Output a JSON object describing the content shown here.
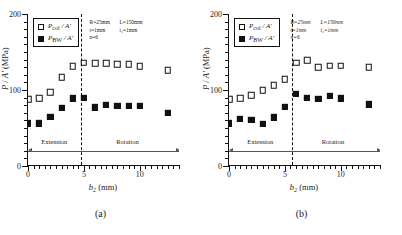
{
  "figure": {
    "panels": [
      {
        "caption": "(a)",
        "legend": [
          {
            "marker": "open-square",
            "label": "P",
            "sub": "col",
            "suffix": " / A'"
          },
          {
            "marker": "filled-square",
            "label": "P",
            "sub": "BW",
            "suffix": " / A'"
          }
        ],
        "annotation": {
          "line1_col1": "R=25mm",
          "line1_col2": "L=150mm",
          "line2_col1": "t=1mm",
          "line2_col2": "t₂=1mm",
          "line3": "n=6"
        },
        "regions": [
          {
            "name": "Extension",
            "center": 2.35
          },
          {
            "name": "Rotation",
            "center": 8.9
          }
        ],
        "divider_x": 4.7
      },
      {
        "caption": "(b)",
        "legend": [
          {
            "marker": "open-square",
            "label": "P",
            "sub": "col",
            "suffix": " / A'"
          },
          {
            "marker": "filled-square",
            "label": "P",
            "sub": "BW",
            "suffix": " / A'"
          }
        ],
        "annotation": {
          "line1_col1": "R=25mm",
          "line1_col2": "L=150mm",
          "line2_col1": "t=1mm",
          "line2_col2": "t₂=1mm",
          "line3": "n=6"
        },
        "regions": [
          {
            "name": "Extension",
            "center": 2.8
          },
          {
            "name": "Rotation",
            "center": 9.3
          }
        ],
        "divider_x": 5.6
      }
    ]
  },
  "chart_data": [
    {
      "type": "scatter",
      "title": "(a)",
      "xlabel": "b₂ (mm)",
      "ylabel": "P / A' (MPa)",
      "xlim": [
        0,
        13.6
      ],
      "ylim": [
        0,
        200
      ],
      "xticks": [
        0,
        5,
        10
      ],
      "yticks": [
        0,
        100,
        200
      ],
      "grid": false,
      "legend_position": "top-left",
      "annotations": [
        "R=25mm",
        "L=150mm",
        "t=1mm",
        "t₂=1mm",
        "n=6"
      ],
      "regions": [
        {
          "label": "Extension",
          "from": 0,
          "to": 4.7
        },
        {
          "label": "Rotation",
          "from": 4.7,
          "to": 13.4
        }
      ],
      "divider_x": 4.7,
      "series": [
        {
          "name": "P_col / A'",
          "marker": "open-square",
          "x": [
            0,
            1,
            2,
            3,
            4,
            5,
            6,
            7,
            8,
            9,
            10,
            12.5
          ],
          "y": [
            88,
            89,
            97,
            117,
            131,
            136,
            135,
            135,
            134,
            134,
            131,
            126
          ]
        },
        {
          "name": "P_BW / A'",
          "marker": "filled-square",
          "x": [
            0,
            1,
            2,
            3,
            4,
            5,
            6,
            7,
            8,
            9,
            10,
            12.5
          ],
          "y": [
            56,
            56,
            65,
            76,
            89,
            90,
            77,
            80,
            79,
            79,
            79,
            70
          ]
        }
      ]
    },
    {
      "type": "scatter",
      "title": "(b)",
      "xlabel": "b₂ (mm)",
      "ylabel": "P / A' (MPa)",
      "xlim": [
        0,
        13.6
      ],
      "ylim": [
        0,
        200
      ],
      "xticks": [
        0,
        5,
        10
      ],
      "yticks": [
        0,
        100,
        200
      ],
      "grid": false,
      "legend_position": "top-left",
      "annotations": [
        "R=25mm",
        "L=150mm",
        "t=1mm",
        "t₂=1mm",
        "n=6"
      ],
      "regions": [
        {
          "label": "Extension",
          "from": 0,
          "to": 5.6
        },
        {
          "label": "Rotation",
          "from": 5.6,
          "to": 13.4
        }
      ],
      "divider_x": 5.6,
      "series": [
        {
          "name": "P_col / A'",
          "marker": "open-square",
          "x": [
            0,
            1,
            2,
            3,
            4,
            5,
            6,
            7,
            8,
            9,
            10,
            12.5
          ],
          "y": [
            88,
            89,
            93,
            100,
            106,
            114,
            136,
            139,
            130,
            132,
            132,
            130
          ]
        },
        {
          "name": "P_BW / A'",
          "marker": "filled-square",
          "x": [
            0,
            1,
            2,
            3,
            4,
            5,
            6,
            7,
            8,
            9,
            10,
            12.5
          ],
          "y": [
            56,
            62,
            61,
            55,
            64,
            78,
            95,
            90,
            88,
            92,
            89,
            81
          ]
        }
      ]
    }
  ]
}
